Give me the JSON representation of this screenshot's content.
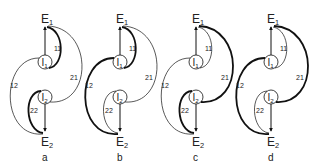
{
  "figure": {
    "node_labels": {
      "E1": "E",
      "E1_sub": "1",
      "E2": "E",
      "E2_sub": "2",
      "I1": "I",
      "I1_sub": "1",
      "I2": "I",
      "I2_sub": "2"
    },
    "edge_labels": {
      "e11": "11",
      "e12": "12",
      "e21": "21",
      "e22": "22"
    },
    "panels": [
      {
        "id": "a",
        "caption": "a",
        "x_offset": 0,
        "bold": [
          "e11",
          "e22"
        ]
      },
      {
        "id": "b",
        "caption": "b",
        "x_offset": 75,
        "bold": [
          "e11",
          "e12"
        ]
      },
      {
        "id": "c",
        "caption": "c",
        "x_offset": 151,
        "bold": [
          "e21",
          "e22"
        ]
      },
      {
        "id": "d",
        "caption": "d",
        "x_offset": 226,
        "bold": [
          "e12",
          "e21"
        ]
      }
    ]
  }
}
